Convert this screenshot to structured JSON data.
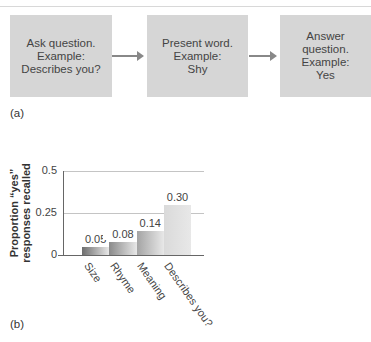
{
  "panel_a": {
    "label": "(a)",
    "steps": [
      {
        "text": "Ask question.\nExample:\nDescribes you?"
      },
      {
        "text": "Present word.\nExample:\nShy"
      },
      {
        "text": "Answer\nquestion.\nExample:\nYes"
      }
    ]
  },
  "panel_b": {
    "label": "(b)"
  },
  "chart_data": {
    "type": "bar",
    "title": "",
    "xlabel": "",
    "ylabel": "Proportion “yes” responses recalled",
    "ylabel_lines": [
      "Proportion “yes”",
      "responses recalled"
    ],
    "categories": [
      "Size",
      "Rhyme",
      "Meaning",
      "Describes you?"
    ],
    "values": [
      0.05,
      0.08,
      0.14,
      0.3
    ],
    "value_labels": [
      "0.05",
      "0.08",
      "0.14",
      "0.30"
    ],
    "yticks": [
      "0",
      "0.25",
      "0.5"
    ],
    "ylim": [
      0,
      0.5
    ],
    "grid": true,
    "legend": null,
    "bar_colors": [
      "#6e6e6e",
      "#8a8a8a",
      "#a4a4a4",
      "#dadada"
    ]
  }
}
